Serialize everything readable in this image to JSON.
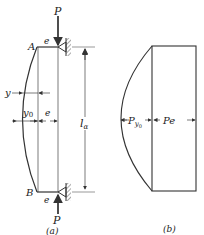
{
  "figure": {
    "panel_a": {
      "caption": "(a)",
      "labels": {
        "load_top": "P",
        "load_bottom": "P",
        "point_top": "A",
        "point_bottom": "B",
        "eccentricity_top": "e",
        "eccentricity_bottom": "e",
        "eccentricity_mid": "e",
        "deflection": "y",
        "max_deflection": "y",
        "max_deflection_sub": "0",
        "length": "l",
        "length_sub": "α"
      }
    },
    "panel_b": {
      "caption": "(b)",
      "labels": {
        "moment_deflection": "P",
        "moment_deflection_sub": "y",
        "moment_deflection_subsub": "0",
        "moment_eccentric": "Pe"
      }
    },
    "colors": {
      "line": "#333333",
      "hatch": "#555555"
    }
  }
}
